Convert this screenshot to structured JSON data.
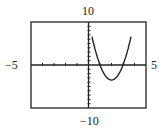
{
  "chart_data": {
    "type": "line",
    "title": "",
    "xlabel": "",
    "ylabel": "",
    "xlim": [
      -5,
      5
    ],
    "ylim": [
      -10,
      10
    ],
    "xscale_ticks": 1,
    "yscale_ticks": 1,
    "grid": false,
    "window_labels": {
      "xmin": "−5",
      "xmax": "5",
      "ymin": "−10",
      "ymax": "10"
    },
    "series": [
      {
        "name": "parabola",
        "x": [
          0.3,
          0.5,
          1,
          1.5,
          2,
          2.5,
          3,
          3.5,
          3.7
        ],
        "y": [
          10.3,
          7.9,
          0,
          -2.6,
          -3.5,
          -2.6,
          0,
          4.4,
          6.8
        ]
      }
    ]
  }
}
